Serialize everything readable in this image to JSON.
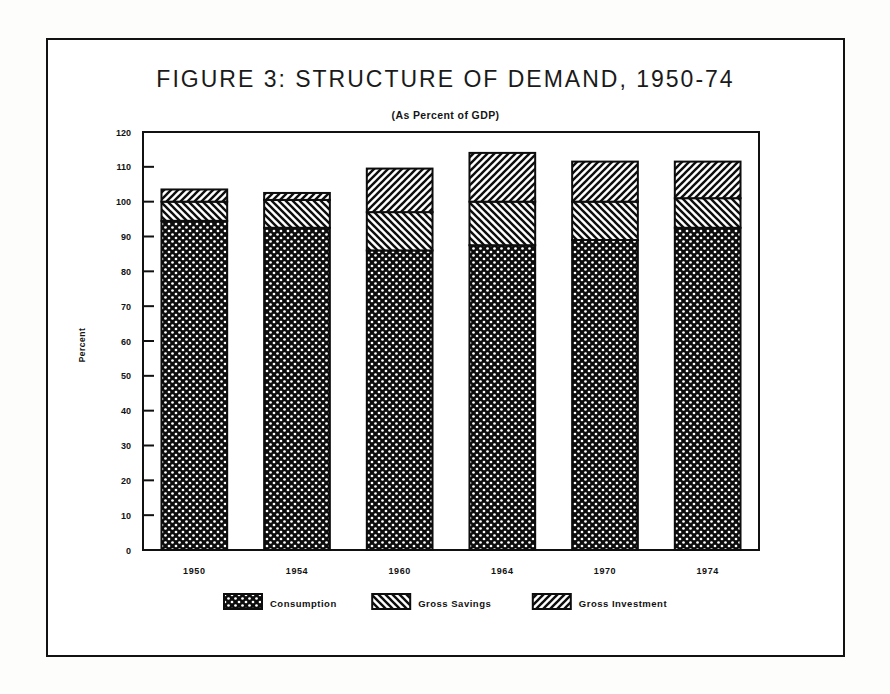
{
  "figure": {
    "title": "FIGURE 3: STRUCTURE OF DEMAND, 1950-74",
    "subtitle": "(As Percent of GDP)",
    "y_axis_title": "Percent"
  },
  "legend": {
    "items": [
      {
        "label": "Consumption",
        "pattern": "crosshatch-dots"
      },
      {
        "label": "Gross Savings",
        "pattern": "diagonal-backslash"
      },
      {
        "label": "Gross Investment",
        "pattern": "diagonal-forwardslash"
      }
    ]
  },
  "axis": {
    "y_ticks": [
      "120",
      "110",
      "100",
      "90",
      "80",
      "70",
      "60",
      "50",
      "40",
      "30",
      "20",
      "10",
      "0"
    ],
    "x_ticks": [
      "1950",
      "1954",
      "1960",
      "1964",
      "1970",
      "1974"
    ]
  },
  "chart_data": {
    "type": "bar",
    "stacked": true,
    "title": "FIGURE 3: STRUCTURE OF DEMAND, 1950-74",
    "subtitle": "(As Percent of GDP)",
    "xlabel": "",
    "ylabel": "Percent",
    "ylim": [
      0,
      120
    ],
    "ytick_step": 10,
    "grid": false,
    "legend_position": "bottom",
    "categories": [
      "1950",
      "1954",
      "1960",
      "1964",
      "1970",
      "1974"
    ],
    "series": [
      {
        "name": "Consumption",
        "values": [
          94.5,
          92.5,
          86.0,
          87.5,
          89.0,
          92.5
        ]
      },
      {
        "name": "Gross Savings",
        "values": [
          5.5,
          8.0,
          11.0,
          12.5,
          11.0,
          8.5
        ]
      },
      {
        "name": "Gross Investment",
        "values": [
          3.5,
          2.0,
          12.5,
          14.0,
          11.5,
          10.5
        ]
      }
    ],
    "totals": [
      103.5,
      102.5,
      109.5,
      114.0,
      111.5,
      111.5
    ]
  }
}
